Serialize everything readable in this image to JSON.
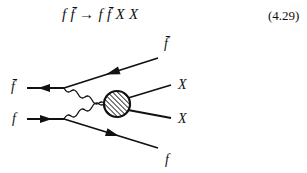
{
  "equation": {
    "process": "f f̄ → f f̄ X X",
    "number": "(4.29)"
  },
  "diagram": {
    "labels": {
      "incoming_antifermion": "f̄",
      "incoming_fermion": "f",
      "outgoing_antifermion": "f̄",
      "outgoing_x1": "X",
      "outgoing_x2": "X",
      "outgoing_fermion": "f"
    },
    "blob_style": "hatched",
    "propagators": "wavy (gauge bosons)"
  }
}
